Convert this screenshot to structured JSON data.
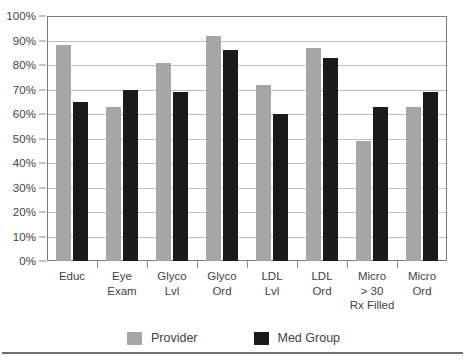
{
  "chart_data": {
    "type": "bar",
    "title": "",
    "xlabel": "",
    "ylabel": "",
    "ylim": [
      0,
      100
    ],
    "ytick_step": 10,
    "ytick_labels": [
      "0%",
      "10%",
      "20%",
      "30%",
      "40%",
      "50%",
      "60%",
      "70%",
      "80%",
      "90%",
      "100%"
    ],
    "grid": true,
    "legend_position": "bottom",
    "categories": [
      "Educ",
      "Eye\nExam",
      "Glyco\nLvl",
      "Glyco\nOrd",
      "LDL\nLvl",
      "LDL\nOrd",
      "Micro\n> 30\nRx Filled",
      "Micro\nOrd"
    ],
    "series": [
      {
        "name": "Provider",
        "color": "#a6a6a6",
        "values": [
          88,
          63,
          81,
          92,
          72,
          87,
          49,
          63
        ]
      },
      {
        "name": "Med Group",
        "color": "#1a1a1a",
        "values": [
          65,
          70,
          69,
          86,
          60,
          83,
          63,
          69
        ]
      }
    ]
  },
  "legend": {
    "items": [
      {
        "label": "Provider",
        "swatch": "provider"
      },
      {
        "label": "Med Group",
        "swatch": "medgroup"
      }
    ]
  },
  "colors": {
    "provider": "#a6a6a6",
    "med_group": "#1a1a1a",
    "gridline": "#bdbdbd",
    "frame": "#7a7a7a",
    "text": "#3f3f3f"
  }
}
